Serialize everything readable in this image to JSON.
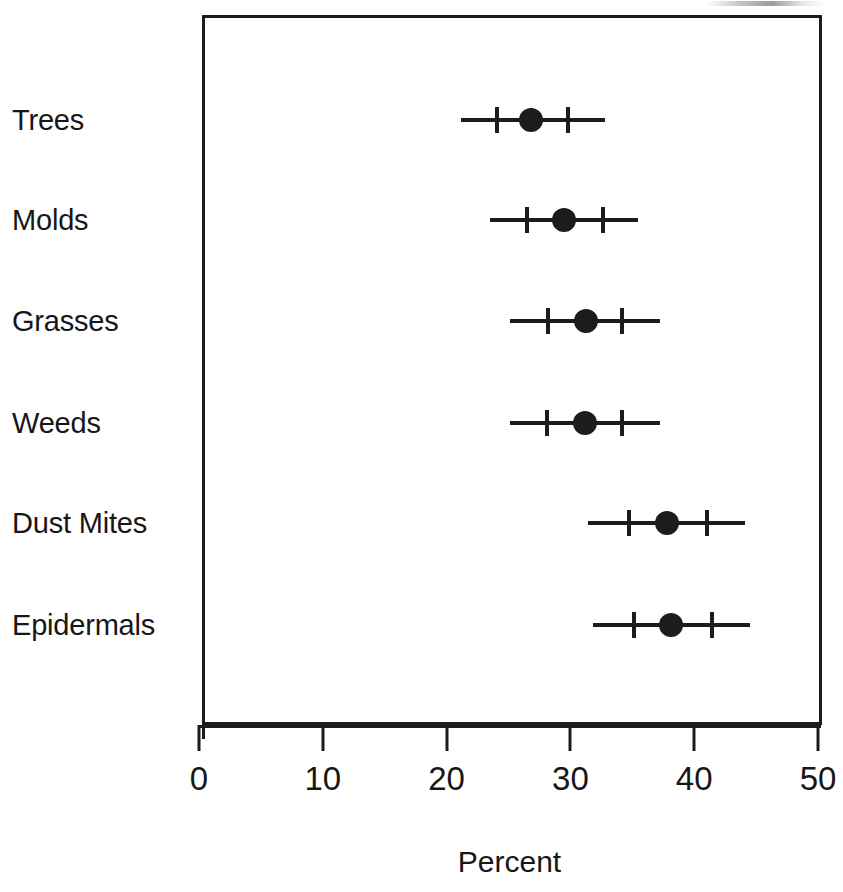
{
  "chart_data": {
    "type": "scatter",
    "subtype": "dot-plot-with-confidence-intervals",
    "title": "",
    "xlabel": "Percent",
    "ylabel": "",
    "xlim": [
      0,
      50
    ],
    "xticks": [
      0,
      10,
      20,
      30,
      40,
      50
    ],
    "xtick_labels": [
      "0",
      "10",
      "20",
      "30",
      "40",
      "50"
    ],
    "grid": false,
    "legend": null,
    "categories": [
      "Trees",
      "Molds",
      "Grasses",
      "Weeds",
      "Dust Mites",
      "Epidermals"
    ],
    "values": [
      26.8,
      29.5,
      31.3,
      31.2,
      37.8,
      38.1
    ],
    "series": [
      {
        "name": "Percent sensitized",
        "points": [
          {
            "category": "Trees",
            "estimate": 26.8,
            "outer_low": 21.2,
            "inner_low": 24.1,
            "inner_high": 29.8,
            "outer_high": 32.8
          },
          {
            "category": "Molds",
            "estimate": 29.5,
            "outer_low": 23.5,
            "inner_low": 26.5,
            "inner_high": 32.6,
            "outer_high": 35.5
          },
          {
            "category": "Grasses",
            "estimate": 31.3,
            "outer_low": 25.1,
            "inner_low": 28.2,
            "inner_high": 34.2,
            "outer_high": 37.2
          },
          {
            "category": "Weeds",
            "estimate": 31.2,
            "outer_low": 25.1,
            "inner_low": 28.1,
            "inner_high": 34.2,
            "outer_high": 37.2
          },
          {
            "category": "Dust Mites",
            "estimate": 37.8,
            "outer_low": 31.4,
            "inner_low": 34.7,
            "inner_high": 41.0,
            "outer_high": 44.1
          },
          {
            "category": "Epidermals",
            "estimate": 38.1,
            "outer_low": 31.8,
            "inner_low": 35.1,
            "inner_high": 41.4,
            "outer_high": 44.5
          }
        ]
      }
    ]
  },
  "axis": {
    "x_title": "Percent",
    "tick_labels": [
      "0",
      "10",
      "20",
      "30",
      "40",
      "50"
    ]
  },
  "colors": {
    "ink": "#1c1c1c",
    "text": "#171717",
    "background": "#ffffff"
  }
}
